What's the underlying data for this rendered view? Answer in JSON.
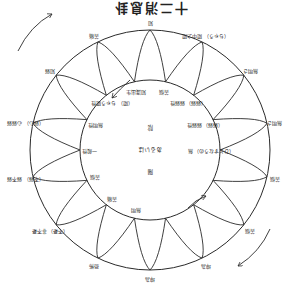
{
  "diagram": {
    "title": "十二消息卦",
    "orientation": "rotated-180",
    "center": {
      "lines": [
        "陽",
        "あるいは",
        "陰"
      ]
    },
    "outer_labels": [
      {
        "id": "o1",
        "text": "坤為",
        "sub": ""
      },
      {
        "id": "o2",
        "text": "恐怖",
        "sub": ""
      },
      {
        "id": "o3",
        "text": "非不憂",
        "sub": "（不憂）"
      },
      {
        "id": "o4",
        "text": "弱不弱",
        "sub": "（不弱）"
      },
      {
        "id": "o5",
        "text": "心弱弱",
        "sub": "（弱心）"
      },
      {
        "id": "o6",
        "text": "知弱",
        "sub": ""
      },
      {
        "id": "o7",
        "text": "苦痛",
        "sub": ""
      },
      {
        "id": "o8",
        "text": "知",
        "sub": ""
      },
      {
        "id": "o9",
        "text": "陽中之陽",
        "sub": "（ちゃう）"
      },
      {
        "id": "o10",
        "text": "無明さ",
        "sub": ""
      },
      {
        "id": "o11",
        "text": "無明さ",
        "sub": ""
      },
      {
        "id": "o12",
        "text": "苦悩",
        "sub": ""
      },
      {
        "id": "o13",
        "text": "苦悩",
        "sub": ""
      },
      {
        "id": "o14",
        "text": "坤為",
        "sub": ""
      }
    ],
    "inner_labels": [
      {
        "id": "i1",
        "text": "無明",
        "sub": ""
      },
      {
        "id": "i2",
        "text": "苦痛",
        "sub": ""
      },
      {
        "id": "i3",
        "text": "苦悩",
        "sub": ""
      },
      {
        "id": "i4",
        "text": "一般性",
        "sub": ""
      },
      {
        "id": "i5",
        "text": "無明性",
        "sub": ""
      },
      {
        "id": "i6",
        "text": "ちゃう陽性",
        "sub": "（陽）"
      },
      {
        "id": "i7",
        "text": "知識出生",
        "sub": ""
      },
      {
        "id": "i8",
        "text": "苦悩",
        "sub": ""
      },
      {
        "id": "i9",
        "text": "弱弱性",
        "sub": "（弱弱）"
      },
      {
        "id": "i10",
        "text": "弱弱性",
        "sub": "（弱弱）"
      },
      {
        "id": "i11",
        "text": "無",
        "sub": "（ひとすなうの）"
      }
    ],
    "arrows": [
      {
        "id": "a1",
        "description": "outer top-left arrow, counter-clockwise"
      },
      {
        "id": "a2",
        "description": "outer bottom-right arrow, counter-clockwise"
      },
      {
        "id": "a3",
        "description": "inner upper arrow"
      },
      {
        "id": "a4",
        "description": "inner lower arrow"
      }
    ],
    "colors": {
      "stroke": "#2a2a2a",
      "text": "#222222",
      "background": "#ffffff"
    }
  }
}
